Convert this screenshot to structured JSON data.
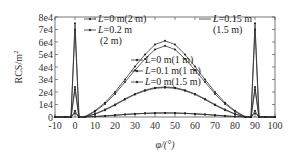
{
  "chart_data": {
    "type": "line",
    "title": "",
    "xlabel": "φ/(°)",
    "ylabel": "RCS/m²",
    "xlim": [
      -10,
      100
    ],
    "ylim": [
      0,
      80000
    ],
    "xticks": [
      -10,
      0,
      10,
      20,
      30,
      40,
      50,
      60,
      70,
      80,
      90,
      100
    ],
    "xtick_labels": [
      "-10",
      "0",
      "10",
      "20",
      "30",
      "40",
      "50",
      "60",
      "70",
      "80",
      "90",
      "100"
    ],
    "yticks": [
      0,
      10000,
      20000,
      30000,
      40000,
      50000,
      60000,
      70000,
      80000
    ],
    "ytick_labels": [
      "0",
      "1e4",
      "2e4",
      "3e4",
      "4e4",
      "5e4",
      "6e4",
      "7e4",
      "8e4"
    ],
    "grid": false,
    "x": [
      -10,
      -5,
      -2,
      0,
      2,
      5,
      10,
      15,
      20,
      25,
      30,
      35,
      40,
      45,
      50,
      55,
      60,
      65,
      70,
      75,
      80,
      85,
      88,
      90,
      92,
      95,
      100
    ],
    "series": [
      {
        "name": "L=0 m(2 m)",
        "values": [
          0,
          0,
          0,
          75000,
          0,
          300,
          5000,
          11500,
          20000,
          30000,
          40500,
          50000,
          58000,
          61000,
          58000,
          50000,
          40500,
          30000,
          20000,
          11500,
          5000,
          300,
          0,
          75000,
          0,
          0,
          0
        ]
      },
      {
        "name": "L=0.2 m(2 m)",
        "values": [
          0,
          0,
          0,
          70000,
          0,
          200,
          4300,
          10500,
          18500,
          28000,
          37500,
          46500,
          54000,
          57000,
          54000,
          46500,
          37500,
          28000,
          18500,
          10500,
          4300,
          200,
          0,
          70000,
          0,
          0,
          0
        ]
      },
      {
        "name": "L=0 m(1 m)",
        "values": [
          0,
          0,
          0,
          5000,
          0,
          100,
          2500,
          6000,
          10000,
          14500,
          18500,
          21500,
          23500,
          24000,
          23500,
          21500,
          18500,
          14500,
          10000,
          6000,
          2500,
          100,
          0,
          5000,
          0,
          0,
          0
        ]
      },
      {
        "name": "L=0.1 m(1 m)",
        "values": [
          0,
          0,
          0,
          3000,
          0,
          100,
          2300,
          5500,
          9500,
          14000,
          18000,
          21000,
          23000,
          23500,
          23000,
          21000,
          18000,
          14000,
          9500,
          5500,
          2300,
          100,
          0,
          3000,
          0,
          0,
          0
        ]
      },
      {
        "name": "L=0 m(1.5 m)",
        "values": [
          0,
          0,
          0,
          24000,
          0,
          50,
          400,
          900,
          1500,
          2100,
          2600,
          3000,
          3200,
          3300,
          3200,
          3000,
          2600,
          2100,
          1500,
          900,
          400,
          50,
          0,
          24000,
          0,
          0,
          0
        ]
      },
      {
        "name": "L=0.15 m(1.5 m)",
        "values": [
          0,
          0,
          0,
          22000,
          0,
          50,
          350,
          850,
          1400,
          2000,
          2500,
          2900,
          3100,
          3200,
          3100,
          2900,
          2500,
          2000,
          1400,
          850,
          350,
          50,
          0,
          22000,
          0,
          0,
          0
        ]
      }
    ],
    "legend": {
      "left_block": [
        "L=0 m(2 m)",
        "L=0.2 m",
        "(2 m)"
      ],
      "right_block": [
        "L=0.15 m",
        "(1.5 m)"
      ],
      "center_block": [
        "L=0 m(1 m)",
        "L=0.1 m(1 m)",
        "L=0 m(1.5 m)"
      ]
    }
  },
  "labels": {
    "ylabel": "RCS/m",
    "ylabel_sup": "2",
    "xlabel": "φ/(°)"
  },
  "legend_text": {
    "l1_L": "L",
    "l1_rest": "=0 m(2 m)",
    "l2_L": "L",
    "l2_rest": "=0.2 m",
    "l2b": "(2 m)",
    "r1_L": "L",
    "r1_rest": "=0.15 m",
    "r1b": "(1.5 m)",
    "c1_L": "L",
    "c1_rest": "=0 m(1 m)",
    "c2_L": "L",
    "c2_rest": "=0.1 m(1 m)",
    "c3_L": "L",
    "c3_rest": "=0 m(1.5 m)"
  }
}
